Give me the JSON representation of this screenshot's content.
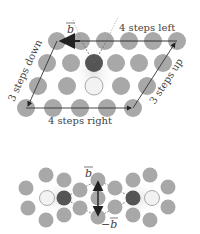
{
  "top_diagram": {
    "labels": {
      "b_vector": "b",
      "left": "4 steps left",
      "right": "4 steps right",
      "down": "3 steps down",
      "up": "3 steps up"
    },
    "colors": {
      "atom": "#a8a8a8",
      "dark_atom": "#555555",
      "light_atom": "#f2f2f2",
      "arrow": "#333333",
      "glow": "#e6e6e6"
    }
  },
  "bottom_diagram": {
    "labels": {
      "b_vector": "b",
      "neg_b_vector": "−b"
    }
  }
}
